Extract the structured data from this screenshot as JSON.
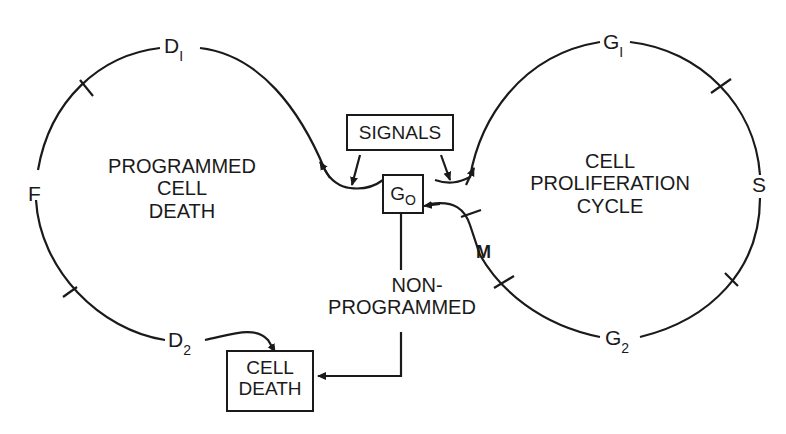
{
  "diagram": {
    "left_cycle": {
      "title_line1": "PROGRAMMED",
      "title_line2": "CELL",
      "title_line3": "DEATH",
      "phases": {
        "d1": {
          "main": "D",
          "sub": "I"
        },
        "f": {
          "main": "F"
        },
        "d2": {
          "main": "D",
          "sub": "2"
        }
      }
    },
    "right_cycle": {
      "title_line1": "CELL",
      "title_line2": "PROLIFERATION",
      "title_line3": "CYCLE",
      "phases": {
        "g1": {
          "main": "G",
          "sub": "I"
        },
        "s": {
          "main": "S"
        },
        "g2": {
          "main": "G",
          "sub": "2"
        },
        "m": {
          "main": "M"
        }
      }
    },
    "signals_box": "SIGNALS",
    "g0_box": {
      "main": "G",
      "sub": "O"
    },
    "non_programmed_line1": "NON-",
    "non_programmed_line2": "PROGRAMMED",
    "cell_death_box_line1": "CELL",
    "cell_death_box_line2": "DEATH",
    "colors": {
      "ink": "#1a1a1a",
      "background": "#ffffff"
    }
  }
}
